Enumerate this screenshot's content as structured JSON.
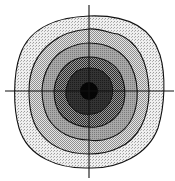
{
  "diagram": {
    "type": "concentric-contour-rings",
    "center": {
      "x": 89,
      "y": 91
    },
    "axes": {
      "horizontal": {
        "x1": 5,
        "x2": 174,
        "y": 91
      },
      "vertical": {
        "x": 89,
        "y1": 5,
        "y2": 178
      },
      "stroke": "#111111"
    },
    "rings": [
      {
        "name": "ring-1-outer",
        "rx": 73,
        "ry": 76,
        "fill": "#e2e2e2",
        "pattern": "fine-dots-light"
      },
      {
        "name": "ring-2",
        "rx": 60,
        "ry": 62,
        "fill": "#cfcfcf",
        "pattern": "checker-light"
      },
      {
        "name": "ring-3",
        "rx": 47,
        "ry": 49,
        "fill": "#9a9a9a",
        "pattern": "medium-gray"
      },
      {
        "name": "ring-4",
        "rx": 35,
        "ry": 36,
        "fill": "#6c6c6c",
        "pattern": "checker-dark"
      },
      {
        "name": "ring-5-inner",
        "rx": 23,
        "ry": 22,
        "fill": "#2e2e2e",
        "pattern": "dark-solid"
      }
    ],
    "core": {
      "name": "center-spot",
      "r": 9,
      "fill": "#050505"
    },
    "ring_stroke": "#111111"
  }
}
